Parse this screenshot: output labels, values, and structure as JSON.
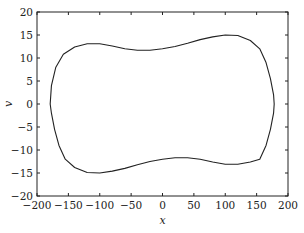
{
  "chart_data": {
    "type": "line",
    "title": "",
    "xlabel": "x",
    "ylabel": "v",
    "xlim": [
      -200,
      200
    ],
    "ylim": [
      -20,
      20
    ],
    "xticks": [
      -200,
      -150,
      -100,
      -50,
      0,
      50,
      100,
      150,
      200
    ],
    "yticks": [
      -20,
      -15,
      -10,
      -5,
      0,
      5,
      10,
      15,
      20
    ],
    "xtick_labels": [
      "−200",
      "−150",
      "−100",
      "−50",
      "0",
      "50",
      "100",
      "150",
      "200"
    ],
    "ytick_labels": [
      "−20",
      "−15",
      "−10",
      "−5",
      "0",
      "5",
      "10",
      "15",
      "20"
    ],
    "grid": false,
    "legend": null,
    "series": [
      {
        "name": "closed orbit",
        "color": "#222222",
        "closed": true,
        "x": [
          -179,
          -177,
          -170,
          -158,
          -140,
          -120,
          -100,
          -80,
          -60,
          -40,
          -20,
          0,
          20,
          40,
          60,
          80,
          100,
          120,
          140,
          155,
          165,
          172,
          177,
          178,
          177,
          172,
          165,
          155,
          140,
          120,
          100,
          80,
          60,
          40,
          20,
          0,
          -20,
          -40,
          -60,
          -80,
          -100,
          -120,
          -140,
          -155,
          -165,
          -172,
          -177
        ],
        "y": [
          0,
          4,
          8,
          10.8,
          12.4,
          13.1,
          13.1,
          12.6,
          12.0,
          11.7,
          11.7,
          12.0,
          12.5,
          13.2,
          14.0,
          14.6,
          15.0,
          14.9,
          13.8,
          12.0,
          9.0,
          5.5,
          2.0,
          0,
          -2.0,
          -5.5,
          -9.0,
          -12.0,
          -12.6,
          -13.1,
          -13.1,
          -12.6,
          -12.0,
          -11.7,
          -11.7,
          -12.0,
          -12.5,
          -13.2,
          -14.0,
          -14.6,
          -15.0,
          -14.9,
          -13.8,
          -12.0,
          -9.0,
          -5.5,
          -2.0
        ]
      }
    ]
  }
}
